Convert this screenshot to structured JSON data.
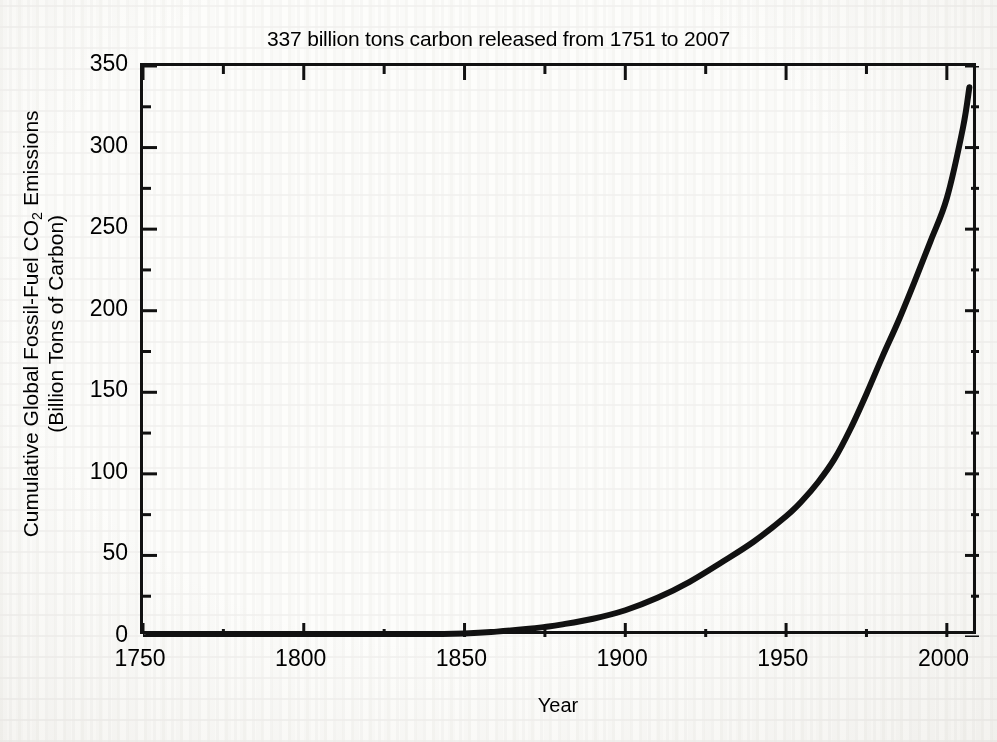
{
  "chart_data": {
    "type": "line",
    "title": "337 billion tons carbon released from 1751 to 2007",
    "xlabel": "Year",
    "ylabel": "Cumulative Global Fossil-Fuel CO2 Emissions",
    "ylabel_line1": "Cumulative Global Fossil-Fuel CO",
    "ylabel_line1_sub": "2",
    "ylabel_line1_tail": " Emissions",
    "ylabel_line2": "(Billion Tons of Carbon)",
    "xlim": [
      1750,
      2010
    ],
    "ylim": [
      0,
      350
    ],
    "grid": false,
    "legend": false,
    "xticks": [
      1750,
      1800,
      1850,
      1900,
      1950,
      2000
    ],
    "xtick_labels": [
      "1750",
      "1800",
      "1850",
      "1900",
      "1950",
      "2000"
    ],
    "xminor_ticks": [
      1775,
      1825,
      1875,
      1925,
      1975
    ],
    "yticks": [
      0,
      50,
      100,
      150,
      200,
      250,
      300,
      350
    ],
    "ytick_labels": [
      "0",
      "50",
      "100",
      "150",
      "200",
      "250",
      "300",
      "350"
    ],
    "yminor_ticks": [
      25,
      75,
      125,
      175,
      225,
      275,
      325
    ],
    "series": [
      {
        "name": "Cumulative fossil-fuel CO2 emissions",
        "color": "#111111",
        "linewidth": 6,
        "x": [
          1751,
          1775,
          1800,
          1825,
          1850,
          1860,
          1870,
          1875,
          1880,
          1890,
          1900,
          1910,
          1920,
          1930,
          1940,
          1950,
          1955,
          1960,
          1965,
          1970,
          1975,
          1980,
          1985,
          1990,
          1995,
          2000,
          2005,
          2007
        ],
        "y": [
          0,
          0.1,
          0.4,
          1.0,
          2.2,
          3.3,
          5.0,
          6.2,
          7.6,
          11.2,
          16.4,
          24.0,
          33.8,
          45.8,
          58.5,
          74.0,
          83.5,
          95.0,
          109.0,
          127.5,
          149.0,
          172.0,
          194.0,
          218.0,
          243.0,
          269.0,
          312.0,
          337.0
        ]
      }
    ],
    "annotation_total": "337",
    "annotation_start_year": "1751",
    "annotation_end_year": "2007"
  }
}
